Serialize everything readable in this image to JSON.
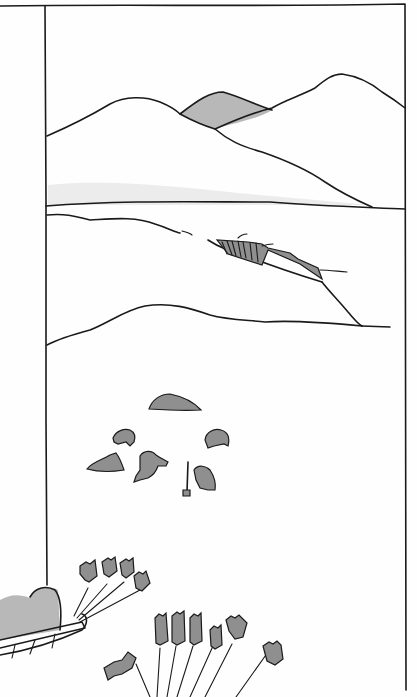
{
  "image": {
    "description": "Pencil and ink illustration of an arctic scene: layered mountains and a frozen sea with a pressure ridge crack, four figures and two bears near a rock on snow, and a dog sled team in the foreground",
    "style": "black ink outlines with grey pencil shading on white",
    "colors": {
      "ink": "#1a1a1a",
      "shade": "#b8b8b8",
      "shade_dark": "#8f8f8f",
      "background": "#fefefe"
    }
  },
  "scene": {
    "panel_frame": "rectangular frame on right with vertical divider line at left",
    "background": [
      "snow mountains",
      "grey distant peak",
      "horizon line"
    ],
    "middle": [
      "frozen sea ice",
      "ice crack / pressure ridge",
      "snow drift"
    ],
    "figures": [
      {
        "kind": "rock",
        "label": "grey rock"
      },
      {
        "kind": "animal",
        "label": "bear left"
      },
      {
        "kind": "animal",
        "label": "bear right"
      },
      {
        "kind": "person",
        "label": "figure crouching by snow block"
      },
      {
        "kind": "person",
        "label": "figure running"
      },
      {
        "kind": "person",
        "label": "figure digging with spade"
      }
    ],
    "foreground": {
      "sled": "loaded sled with bundles",
      "dogs_count": 13
    }
  }
}
